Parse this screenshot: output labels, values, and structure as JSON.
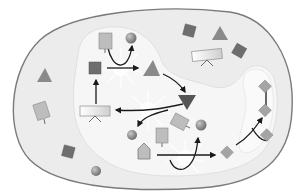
{
  "diagram": {
    "type": "cell-signaling-pathway",
    "colors": {
      "background": "#ffffff",
      "cell_fill": "#ececec",
      "cell_stroke": "#7a7a7a",
      "inner_region_fill": "#f6f6f6",
      "dark_square": "#6e6e6e",
      "medium_shape": "#8a8a8a",
      "light_shape": "#b8b8b8",
      "sphere": "#909090",
      "arrow": "#1a1a1a",
      "receptor_fill": "#e2e2e2",
      "burst": "#ffffff"
    },
    "elements": {
      "outer_cell": "cell-membrane",
      "inner_compartment": "cytoplasm-region",
      "right_lobe": "side-compartment",
      "receptors": 3,
      "squares": 6,
      "triangles": 4,
      "spheres": 4,
      "diamonds": 5,
      "pentagons": 1,
      "reaction_bursts": 3
    }
  }
}
